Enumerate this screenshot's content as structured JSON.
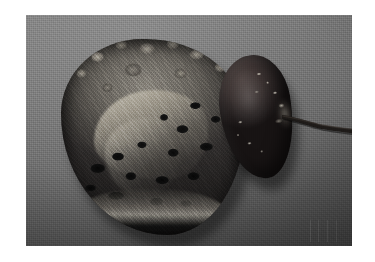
{
  "image": {
    "kind": "gross-pathology-photograph",
    "modality": "Gross specimen photograph",
    "background_color": "#6f6f6f",
    "border_color": "#ffffff",
    "photo_rect": {
      "x": 26,
      "y": 15,
      "width": 326,
      "height": 231
    },
    "alt_text": "Gross pathology photograph on a gray background showing a large bisected cystic and necrotic renal tumour mass on the left and an intact dark kidney with attached ureter on the right."
  },
  "specimens": [
    {
      "id": "tumor-mass",
      "label": "Bisected cystic tumour mass",
      "position": "left",
      "description": "Cut surface of a large multiloculated mass with irregular nodular tan-grey tissue, pale fibrous septa and numerous dark haemorrhagic-necrotic cystic spaces; a pale capsular rim is visible along the inferior margin.",
      "colors": {
        "tissue_light": "#b4afa4",
        "tissue_mid": "#6f6b64",
        "tissue_dark": "#343130",
        "septum": "#d6d1c4",
        "cyst_cavity": "#0a0a0a"
      },
      "features": [
        "nodular cut surface",
        "pale fibrous septa",
        "multiple dark cystic cavities",
        "haemorrhagic necrosis",
        "pale capsular rim"
      ]
    },
    {
      "id": "kidney",
      "label": "Intact kidney with ureter",
      "position": "right",
      "description": "Bean-shaped intact kidney with a smooth dark congested capsular surface bearing pale flecks of adherent perinephric fat; a thin ureter extends from the hilum toward the right.",
      "colors": {
        "capsule_light": "#4a3f3d",
        "capsule_mid": "#322a2a",
        "capsule_dark": "#141111",
        "fleck": "#e2ddd0"
      },
      "features": [
        "smooth capsule",
        "pale surface flecks",
        "hilar region",
        "attached ureter"
      ]
    }
  ],
  "ureter": {
    "id": "ureter",
    "label": "Ureter",
    "description": "Thin tubular structure arising from the renal hilum, running to the right and slightly downward, tapering toward the right edge of the photograph.",
    "color": "#1a1715"
  },
  "annotations": {
    "plate_marks": "faint vertical marks in lower right corner",
    "text_labels": [],
    "scale_bar": null,
    "caption": ""
  }
}
